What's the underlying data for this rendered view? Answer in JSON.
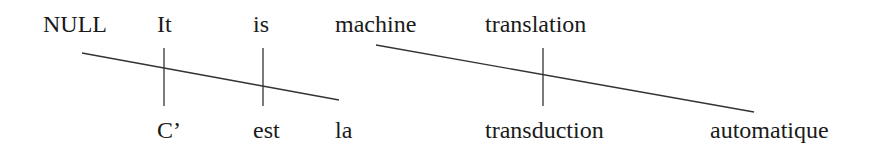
{
  "diagram": {
    "type": "word-alignment",
    "source_words": [
      {
        "text": "NULL",
        "x": 43
      },
      {
        "text": "It",
        "x": 157
      },
      {
        "text": "is",
        "x": 253
      },
      {
        "text": "machine",
        "x": 335
      },
      {
        "text": "translation",
        "x": 485
      }
    ],
    "target_words": [
      {
        "text": "C’",
        "x": 157
      },
      {
        "text": "est",
        "x": 253
      },
      {
        "text": "la",
        "x": 335
      },
      {
        "text": "transduction",
        "x": 485
      },
      {
        "text": "automatique",
        "x": 710
      }
    ],
    "alignments": [
      {
        "from": "NULL",
        "to": "la",
        "style": "diagonal"
      },
      {
        "from": "It",
        "to": "C’",
        "style": "vertical"
      },
      {
        "from": "is",
        "to": "est",
        "style": "vertical"
      },
      {
        "from": "machine",
        "to": "automatique",
        "style": "diagonal"
      },
      {
        "from": "translation",
        "to": "transduction",
        "style": "vertical"
      }
    ],
    "line_color": "#333333"
  }
}
